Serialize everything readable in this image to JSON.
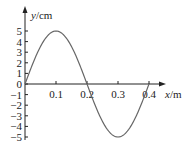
{
  "chart_data": {
    "type": "line",
    "title": "",
    "xlabel": "x/m",
    "ylabel": "y/cm",
    "xlabel_var": "x",
    "xlabel_unit": "/m",
    "ylabel_var": "y",
    "ylabel_unit": "/cm",
    "x_ticks": [
      "0.1",
      "0.2",
      "0.3",
      "0.4"
    ],
    "y_ticks": [
      "5",
      "4",
      "3",
      "2",
      "1",
      "0",
      "-1",
      "-2",
      "-3",
      "-4",
      "-5"
    ],
    "xlim": [
      0,
      0.45
    ],
    "ylim": [
      -5,
      5
    ],
    "grid": false,
    "series": [
      {
        "name": "wave",
        "description": "sinusoid y = 5 sin(2πx/0.4) cm",
        "x": [
          0,
          0.05,
          0.1,
          0.15,
          0.2,
          0.25,
          0.3,
          0.35,
          0.4
        ],
        "values": [
          0,
          3.54,
          5,
          3.54,
          0,
          -3.54,
          -5,
          -3.54,
          0
        ]
      }
    ],
    "amplitude_cm": 5,
    "wavelength_m": 0.4,
    "curve_color": "#666666",
    "axis_color": "#222222"
  }
}
